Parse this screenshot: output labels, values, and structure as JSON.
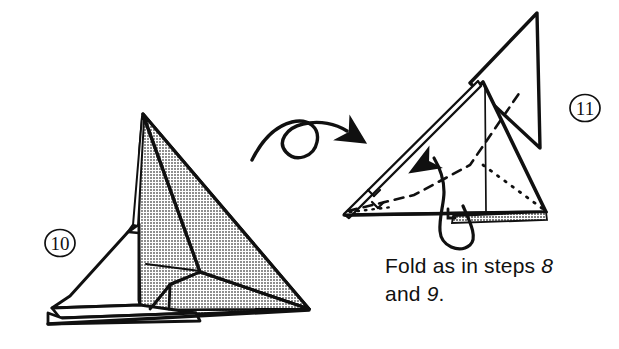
{
  "page": {
    "background_color": "#ffffff",
    "ink_color": "#101010",
    "shade_color": "#9a9a9a",
    "width": 619,
    "height": 349
  },
  "figures": [
    {
      "id": "figure-10",
      "step_number": "10",
      "step_label_position": {
        "x": 60,
        "y": 243
      },
      "description": "Shaded three-dimensional folded paper form, apex upper-centre with layered white flaps along the lower left edge"
    },
    {
      "id": "figure-11",
      "step_number": "11",
      "step_label_position": {
        "x": 585,
        "y": 108
      },
      "description": "Triangular folded form seen after turning over, with valley-fold dashed line, hidden dotted line, upright rear fin and wrap-around fold arrow"
    }
  ],
  "arrows": [
    {
      "name": "turn-over-arrow",
      "type": "loop-with-arrowhead",
      "meaning": "turn the model over"
    },
    {
      "name": "fold-arrow",
      "type": "wrap-around-curved",
      "meaning": "bring the flap around and up"
    }
  ],
  "fold_lines": [
    {
      "name": "valley-fold-line",
      "style": "dashed",
      "meaning": "valley fold"
    },
    {
      "name": "hidden-edge-line",
      "style": "dotted",
      "meaning": "hidden edge behind paper"
    },
    {
      "name": "crease-line",
      "style": "solid-thin",
      "meaning": "existing crease"
    }
  ],
  "caption": {
    "line1_prefix": "Fold as in steps ",
    "line1_number": "8",
    "line2_prefix": "and ",
    "line2_number": "9",
    "line2_suffix": "."
  },
  "step_numbers": {
    "left": "10",
    "right": "11"
  }
}
